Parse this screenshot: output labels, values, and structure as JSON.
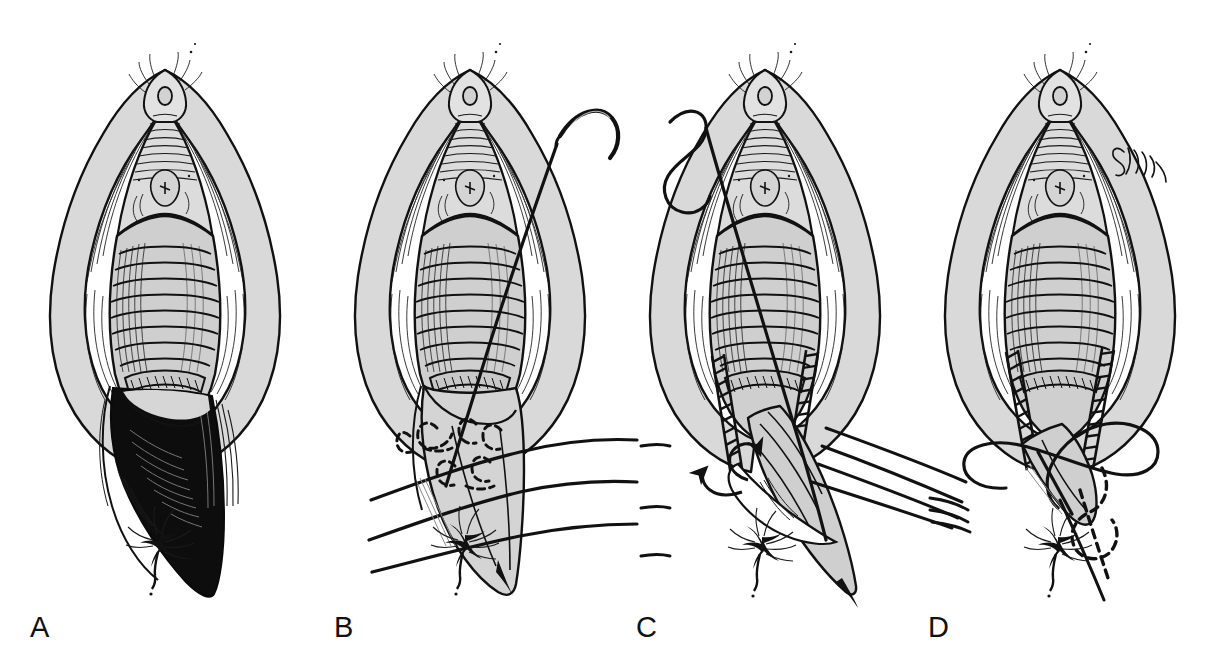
{
  "plate": {
    "title": "Perineal laceration / episiotomy repair — four stage plate",
    "medium": "pen-and-ink line drawing",
    "background_color": "#ffffff",
    "ink_color": "#111111",
    "tissue_fill_color": "#d9d9d9",
    "tissue_fill_dark_color": "#c2c2c2",
    "defect_fill_color": "#0d0d0d",
    "width": 1212,
    "height": 664,
    "artist_signature": "cursive artist signature",
    "panel_count": 4
  },
  "panels": [
    {
      "id": "a",
      "label": "A",
      "label_x": 30,
      "label_y": 613,
      "center_x": 165,
      "caption": "Open perineal defect with exposed dark wound bed prior to repair",
      "features": [
        "labia majora retracted laterally",
        "clitoris and urethral meatus at apex",
        "vaginal canal with transverse rugae",
        "dark triangular perineal defect extending toward anus",
        "anus with radiating folds at inferior margin"
      ],
      "has_needle": false,
      "has_sutures": false,
      "has_arrows": false
    },
    {
      "id": "b",
      "label": "B",
      "label_x": 334,
      "label_y": 613,
      "center_x": 470,
      "caption": "Curved needle placing interrupted buried sutures; strands held untied",
      "features": [
        "curved surgical needle entering upper right",
        "single suture strand crossing the field diagonally",
        "six dashed buried suture loops in the perineal body",
        "three long horizontal suture strands laid across the field",
        "perineal flap shaded light gray"
      ],
      "has_needle": true,
      "has_sutures": true,
      "suture_strand_count": 3,
      "buried_loop_count": 6,
      "has_arrows": false
    },
    {
      "id": "c",
      "label": "C",
      "label_x": 636,
      "label_y": 613,
      "center_x": 765,
      "caption": "Sutures drawn up under traction; vaginal mucosa closed with ladder stitches",
      "features": [
        "long suture thread with free loop at upper left",
        "two ladder-pattern running suture lines along vaginal walls",
        "four suture strands tensioned to the lower right",
        "two curved arrows indicating direction of traction",
        "perineal flap elevated"
      ],
      "has_needle": false,
      "has_sutures": true,
      "suture_strand_count": 4,
      "arrow_count": 2,
      "has_arrows": true
    },
    {
      "id": "d",
      "label": "D",
      "label_x": 928,
      "label_y": 613,
      "center_x": 1060,
      "caption": "Completed approximation with running subcuticular closure and buried tail",
      "features": [
        "ladder-pattern running sutures on both vaginal walls",
        "large looping suture thread crossing below the introitus",
        "dashed buried subcuticular suture descending to the anus",
        "artist signature at upper right",
        "anus with radiating folds at inferior margin"
      ],
      "has_needle": false,
      "has_sutures": true,
      "has_arrows": false,
      "has_signature": true
    }
  ],
  "labels": {
    "a": "A",
    "b": "B",
    "c": "C",
    "d": "D"
  }
}
